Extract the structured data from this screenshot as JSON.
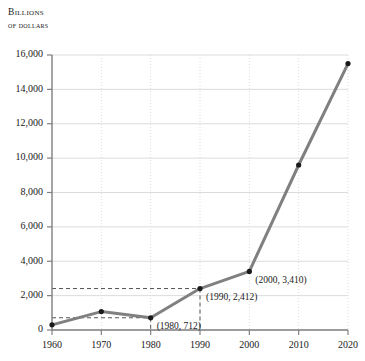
{
  "chart_data": {
    "type": "line",
    "title": "",
    "ylabel_line1": "Billions",
    "ylabel_line2": "of dollars",
    "xlabel": "",
    "x": [
      1960,
      1970,
      1980,
      1990,
      2000,
      2010,
      2020
    ],
    "values": [
      300,
      1070,
      712,
      2412,
      3410,
      9600,
      15500
    ],
    "series": [
      {
        "name": "Billions of dollars",
        "values": [
          300,
          1070,
          712,
          2412,
          3410,
          9600,
          15500
        ]
      }
    ],
    "xlim": [
      1960,
      2020
    ],
    "ylim": [
      0,
      16000
    ],
    "xticks": [
      1960,
      1970,
      1980,
      1990,
      2000,
      2010,
      2020
    ],
    "xtick_labels": [
      "1960",
      "1970",
      "1980",
      "1990",
      "2000",
      "2010",
      "2020"
    ],
    "yticks": [
      0,
      2000,
      4000,
      6000,
      8000,
      10000,
      12000,
      14000,
      16000
    ],
    "ytick_labels": [
      "0",
      "2,000",
      "4,000",
      "6,000",
      "8,000",
      "10,000",
      "12,000",
      "14,000",
      "16,000"
    ],
    "grid": true,
    "grid_horizontal_style": "solid",
    "grid_vertical_style": "dotted",
    "legend": false,
    "legend_position": "none",
    "line_color": "#808080",
    "marker_color": "#1a1a1a",
    "grid_color": "#dcdcdc",
    "axis_color": "#808080",
    "guide_color": "#555555",
    "annotations": [
      {
        "label": "(1980, 712)",
        "x": 1980,
        "y": 712
      },
      {
        "label": "(1990, 2,412)",
        "x": 1990,
        "y": 2412
      },
      {
        "label": "(2000, 3,410)",
        "x": 2000,
        "y": 3410
      }
    ],
    "guide_lines": [
      {
        "y": 712,
        "x": 1980
      },
      {
        "y": 2412,
        "x": 1990
      }
    ]
  }
}
